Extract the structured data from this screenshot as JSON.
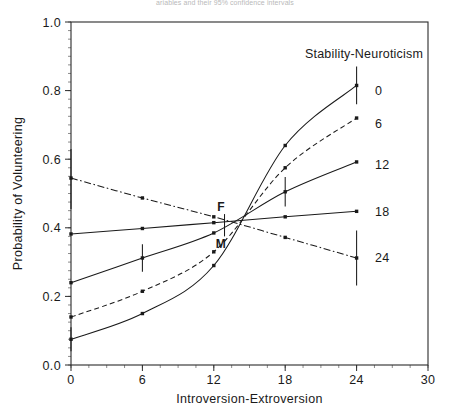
{
  "figure": {
    "top_caption": "ariables and their 95% confidence intervals",
    "width": 450,
    "height": 407
  },
  "chart_data": {
    "type": "line",
    "title": "",
    "xlabel": "Introversion-Extroversion",
    "ylabel": "Probability of Volunteering",
    "xlim": [
      0,
      30
    ],
    "ylim": [
      0.0,
      1.0
    ],
    "xticks": [
      0,
      6,
      12,
      18,
      24,
      30
    ],
    "xticklabels": [
      "0",
      "6",
      "12",
      "18",
      "24",
      "30"
    ],
    "yticks": [
      0.0,
      0.2,
      0.4,
      0.6,
      0.8,
      1.0
    ],
    "yticklabels": [
      "0.0",
      "0.2",
      "0.4",
      "0.6",
      "0.8",
      "1.0"
    ],
    "grid": false,
    "legend_title": "Stability-Neuroticism",
    "legend_position": "right-inline",
    "x": [
      0,
      6,
      12,
      18,
      24
    ],
    "series": [
      {
        "name": "0",
        "label": "0",
        "linestyle": "solid",
        "values": [
          0.075,
          0.15,
          0.29,
          0.64,
          0.815
        ],
        "errorbars": [
          {
            "x": 0,
            "y": 0.075,
            "low": 0.04,
            "high": 0.11
          },
          {
            "x": 24,
            "y": 0.815,
            "low": 0.76,
            "high": 0.87
          }
        ],
        "legend_label_y": 0.8
      },
      {
        "name": "6",
        "label": "6",
        "linestyle": "dashed",
        "values": [
          0.14,
          0.215,
          0.33,
          0.575,
          0.72
        ],
        "errorbars": [],
        "legend_label_y": 0.705
      },
      {
        "name": "12",
        "label": "12",
        "linestyle": "solid",
        "values": [
          0.24,
          0.312,
          0.385,
          0.505,
          0.592
        ],
        "errorbars": [
          {
            "x": 6,
            "y": 0.312,
            "low": 0.272,
            "high": 0.352
          },
          {
            "x": 18,
            "y": 0.505,
            "low": 0.462,
            "high": 0.548
          }
        ],
        "legend_label_y": 0.585
      },
      {
        "name": "18",
        "label": "18",
        "linestyle": "solid",
        "values": [
          0.382,
          0.398,
          0.415,
          0.432,
          0.448
        ],
        "errorbars": [],
        "legend_label_y": 0.448
      },
      {
        "name": "24",
        "label": "24",
        "linestyle": "dashdot",
        "values": [
          0.545,
          0.487,
          0.432,
          0.372,
          0.312
        ],
        "errorbars": [
          {
            "x": 0,
            "y": 0.545,
            "low": 0.455,
            "high": 0.63
          },
          {
            "x": 24,
            "y": 0.312,
            "low": 0.232,
            "high": 0.392
          }
        ],
        "legend_label_y": 0.312
      }
    ],
    "annotations": [
      {
        "text": "F",
        "x": 12.6,
        "y": 0.462,
        "name": "female-label"
      },
      {
        "text": "M",
        "x": 12.6,
        "y": 0.352,
        "name": "male-label"
      }
    ],
    "center_errorbar": {
      "x": 12.9,
      "low": 0.375,
      "high": 0.44
    }
  }
}
